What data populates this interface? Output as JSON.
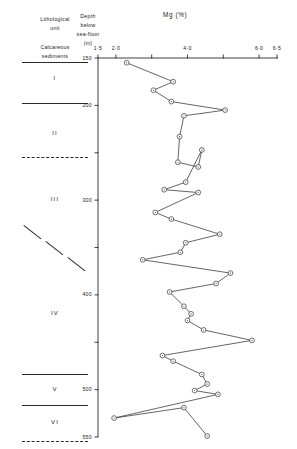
{
  "header": {
    "col1_line1": "Lithological",
    "col1_line2": "unit",
    "col2_line1": "Depth",
    "col2_line2": "below",
    "col2_line3": "sea-floor",
    "col2_line4": "(m)",
    "chart_title": "Mg (%)",
    "sediment_caption_line1": "Calcareous",
    "sediment_caption_line2": "sediments"
  },
  "lithological_units": [
    {
      "label": "I",
      "center_depth": 172
    },
    {
      "label": "II",
      "center_depth": 230
    },
    {
      "label": "III",
      "center_depth": 300
    },
    {
      "label": "IV",
      "center_depth": 420
    },
    {
      "label": "V",
      "center_depth": 500
    },
    {
      "label": "VI",
      "center_depth": 535
    }
  ],
  "unit_boundaries": [
    {
      "depth": 154,
      "style": "solid"
    },
    {
      "depth": 197,
      "style": "solid"
    },
    {
      "depth": 255,
      "style": "dashed"
    },
    {
      "depth": 345,
      "style": "diagonal"
    },
    {
      "depth": 483,
      "style": "solid"
    },
    {
      "depth": 516,
      "style": "solid"
    },
    {
      "depth": 554,
      "style": "dashed"
    }
  ],
  "chart_data": {
    "type": "line",
    "title": "Mg (%)",
    "xlabel": "Mg (%)",
    "ylabel": "Depth below sea-floor (m)",
    "xlim": [
      1.5,
      6.5
    ],
    "ylim": [
      150,
      555
    ],
    "y_inverted": true,
    "grid": false,
    "legend": null,
    "xticks": [
      1.5,
      2.0,
      3.0,
      4.0,
      5.0,
      6.0,
      6.5
    ],
    "xtick_labels": [
      "1·5",
      "2·0",
      "",
      "4·0",
      "",
      "6·0",
      "6·5"
    ],
    "yticks": [
      150,
      200,
      250,
      300,
      350,
      400,
      450,
      500,
      550
    ],
    "ytick_labels": [
      "150",
      "200",
      "",
      "300",
      "",
      "400",
      "",
      "500",
      "550"
    ],
    "marker": "circle-dot",
    "series": [
      {
        "name": "Mg",
        "points": [
          {
            "mg": 2.3,
            "depth": 155
          },
          {
            "mg": 3.6,
            "depth": 175
          },
          {
            "mg": 3.05,
            "depth": 184
          },
          {
            "mg": 3.55,
            "depth": 196
          },
          {
            "mg": 5.05,
            "depth": 205
          },
          {
            "mg": 3.9,
            "depth": 211
          },
          {
            "mg": 3.78,
            "depth": 233
          },
          {
            "mg": 3.73,
            "depth": 260
          },
          {
            "mg": 4.3,
            "depth": 265
          },
          {
            "mg": 4.4,
            "depth": 247
          },
          {
            "mg": 3.95,
            "depth": 281
          },
          {
            "mg": 3.35,
            "depth": 289
          },
          {
            "mg": 4.3,
            "depth": 292
          },
          {
            "mg": 3.1,
            "depth": 313
          },
          {
            "mg": 3.55,
            "depth": 320
          },
          {
            "mg": 4.9,
            "depth": 336
          },
          {
            "mg": 3.95,
            "depth": 345
          },
          {
            "mg": 3.8,
            "depth": 355
          },
          {
            "mg": 2.75,
            "depth": 363
          },
          {
            "mg": 5.2,
            "depth": 377
          },
          {
            "mg": 4.8,
            "depth": 388
          },
          {
            "mg": 3.5,
            "depth": 397
          },
          {
            "mg": 3.9,
            "depth": 412
          },
          {
            "mg": 4.1,
            "depth": 420
          },
          {
            "mg": 4.0,
            "depth": 427
          },
          {
            "mg": 4.45,
            "depth": 437
          },
          {
            "mg": 5.8,
            "depth": 448
          },
          {
            "mg": 3.3,
            "depth": 464
          },
          {
            "mg": 3.6,
            "depth": 470
          },
          {
            "mg": 4.4,
            "depth": 484
          },
          {
            "mg": 4.55,
            "depth": 494
          },
          {
            "mg": 4.2,
            "depth": 501
          },
          {
            "mg": 4.85,
            "depth": 505
          },
          {
            "mg": 1.95,
            "depth": 530
          },
          {
            "mg": 3.9,
            "depth": 519
          },
          {
            "mg": 4.55,
            "depth": 549
          }
        ]
      }
    ]
  }
}
